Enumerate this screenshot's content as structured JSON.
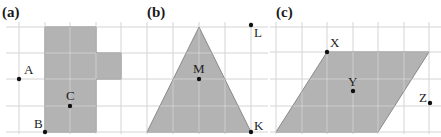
{
  "colors": {
    "grid": "#d4d4d4",
    "shape_fill": "#b3b3b3",
    "shape_stroke": "#8a8a8a",
    "inner_grid": "#e8e8e8",
    "point": "#111111",
    "text": "#1a1a1a"
  },
  "panels": [
    {
      "id": "a",
      "label": "(a)",
      "label_pos": [
        2,
        17
      ],
      "grid": {
        "xs": [
          19,
          45,
          70,
          96,
          121
        ],
        "ys": [
          27,
          53,
          79,
          106,
          132
        ],
        "x_range": [
          6,
          140
        ],
        "y_range": [
          22,
          134
        ]
      },
      "shape": {
        "type": "polygon",
        "points": [
          [
            45,
            27
          ],
          [
            96,
            27
          ],
          [
            96,
            53
          ],
          [
            121,
            53
          ],
          [
            121,
            79
          ],
          [
            96,
            79
          ],
          [
            96,
            132
          ],
          [
            45,
            132
          ]
        ]
      },
      "points": [
        {
          "name": "A",
          "x": 19,
          "y": 79,
          "label_dx": 5,
          "label_dy": -5
        },
        {
          "name": "C",
          "x": 70,
          "y": 106,
          "label_dx": -4,
          "label_dy": -6
        },
        {
          "name": "B",
          "x": 45,
          "y": 132,
          "label_dx": -11,
          "label_dy": -4
        }
      ]
    },
    {
      "id": "b",
      "label": "(b)",
      "label_pos": [
        147,
        17
      ],
      "grid": {
        "xs": [
          147,
          173,
          199,
          225,
          251
        ],
        "ys": [
          27,
          53,
          79,
          106,
          132
        ],
        "x_range": [
          140,
          268
        ],
        "y_range": [
          22,
          134
        ]
      },
      "shape": {
        "type": "polygon",
        "points": [
          [
            199,
            27
          ],
          [
            251,
            132
          ],
          [
            147,
            132
          ]
        ]
      },
      "points": [
        {
          "name": "M",
          "x": 199,
          "y": 79,
          "label_dx": -6,
          "label_dy": -6
        },
        {
          "name": "L",
          "x": 251,
          "y": 25,
          "label_dx": 3,
          "label_dy": 12
        },
        {
          "name": "K",
          "x": 251,
          "y": 132,
          "label_dx": 3,
          "label_dy": -2
        }
      ]
    },
    {
      "id": "c",
      "label": "(c)",
      "label_pos": [
        276,
        17
      ],
      "grid": {
        "xs": [
          276,
          302,
          327,
          353,
          378,
          404,
          429
        ],
        "ys": [
          27,
          52,
          79,
          106,
          132
        ],
        "x_range": [
          270,
          441
        ],
        "y_range": [
          22,
          134
        ]
      },
      "shape": {
        "type": "polygon",
        "points": [
          [
            327,
            52
          ],
          [
            429,
            52
          ],
          [
            378,
            132
          ],
          [
            276,
            132
          ]
        ]
      },
      "points": [
        {
          "name": "X",
          "x": 327,
          "y": 52,
          "label_dx": 3,
          "label_dy": -5
        },
        {
          "name": "Y",
          "x": 353,
          "y": 91,
          "label_dx": -5,
          "label_dy": -5
        },
        {
          "name": "Z",
          "x": 430,
          "y": 103,
          "label_dx": -11,
          "label_dy": -1
        }
      ]
    }
  ]
}
